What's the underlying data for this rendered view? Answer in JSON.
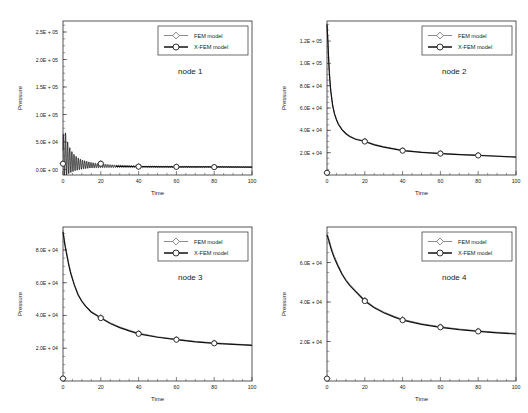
{
  "figure": {
    "background": "#ffffff",
    "panel_count": 4,
    "colors": {
      "fem": "#8c8c8c",
      "xfem": "#111111",
      "axis": "#2b2b2b"
    }
  },
  "legend": {
    "fem_label": "FEM model",
    "xfem_label": "X-FEM model",
    "fem_marker": "diamond-open",
    "xfem_marker": "circle-open",
    "position": "top-right"
  },
  "axes": {
    "xlabel": "Time",
    "ylabel": "Pressure",
    "xticks": [
      "0",
      "20",
      "40",
      "60",
      "80",
      "100"
    ],
    "xlim": [
      0,
      100
    ]
  },
  "chart_data": [
    {
      "type": "line",
      "title": "node 1",
      "xlabel": "Time",
      "ylabel": "Pressure",
      "xlim": [
        0,
        100
      ],
      "ylim": [
        -10000,
        270000
      ],
      "xticks": [
        0,
        20,
        40,
        60,
        80,
        100
      ],
      "yticks": [
        0,
        50000,
        100000,
        150000,
        200000,
        250000
      ],
      "ytick_labels": [
        "0.0E + 00",
        "5.0E + 04",
        "1.0E + 05",
        "1.5E + 05",
        "2.0E + 05",
        "2.5E + 05"
      ],
      "grid": false,
      "legend_position": "top-right",
      "note": "strongly oscillatory decaying pressure response",
      "oscillatory": true,
      "series": [
        {
          "name": "FEM model",
          "marker": "diamond-open",
          "color": "#8c8c8c",
          "marker_x": [
            0,
            20,
            40,
            60,
            80
          ],
          "marker_y": [
            11000,
            11000,
            5500,
            5000,
            4500
          ]
        },
        {
          "name": "X-FEM model",
          "marker": "circle-open",
          "color": "#111111",
          "marker_x": [
            0,
            20,
            40,
            60,
            80
          ],
          "marker_y": [
            10500,
            10500,
            5200,
            4800,
            4300
          ]
        }
      ],
      "envelope": {
        "x": [
          0,
          1,
          2,
          4,
          6,
          8,
          10,
          14,
          18,
          22,
          26,
          30,
          36,
          42,
          50,
          60,
          75,
          90,
          100
        ],
        "upper": [
          110000,
          96000,
          80000,
          58000,
          46000,
          38000,
          32000,
          24000,
          19000,
          16000,
          13500,
          11500,
          9500,
          8200,
          7200,
          6400,
          5800,
          5400,
          5200
        ],
        "lower": [
          0,
          2000,
          2500,
          1500,
          1000,
          800,
          700,
          600,
          500,
          500,
          400,
          400,
          400,
          400,
          400,
          400,
          400,
          400,
          400
        ],
        "center": [
          11000,
          30000,
          22000,
          15000,
          12000,
          10000,
          9000,
          8000,
          7000,
          6500,
          6000,
          5800,
          5500,
          5200,
          5000,
          4800,
          4600,
          4500,
          4400
        ]
      }
    },
    {
      "type": "line",
      "title": "node 2",
      "xlabel": "Time",
      "ylabel": "Pressure",
      "xlim": [
        0,
        100
      ],
      "ylim": [
        0,
        138000
      ],
      "xticks": [
        0,
        20,
        40,
        60,
        80,
        100
      ],
      "yticks": [
        20000,
        40000,
        60000,
        80000,
        100000,
        120000
      ],
      "ytick_labels": [
        "2.0E + 04",
        "4.0E + 04",
        "6.0E + 04",
        "8.0E + 04",
        "1.0E + 05",
        "1.2E + 05"
      ],
      "grid": false,
      "legend_position": "top-right",
      "oscillatory": false,
      "x": [
        0,
        0.5,
        1,
        1.5,
        2,
        3,
        4,
        5,
        6,
        8,
        10,
        12,
        15,
        20,
        25,
        30,
        35,
        40,
        50,
        60,
        70,
        80,
        90,
        100
      ],
      "series": [
        {
          "name": "FEM model",
          "marker": "diamond-open",
          "color": "#8c8c8c",
          "values": [
            136000,
            120000,
            100000,
            86000,
            76000,
            63000,
            55000,
            50000,
            46000,
            41000,
            37500,
            35000,
            32500,
            30500,
            27500,
            25500,
            23800,
            22200,
            20500,
            19500,
            18500,
            17800,
            17000,
            16200
          ],
          "marker_x": [
            0,
            20,
            40,
            60,
            80
          ],
          "marker_y": [
            2000,
            30500,
            22200,
            19500,
            17800
          ]
        },
        {
          "name": "X-FEM model",
          "marker": "circle-open",
          "color": "#111111",
          "values": [
            135000,
            118000,
            98500,
            85000,
            75000,
            62000,
            54500,
            49500,
            45500,
            40500,
            37000,
            34500,
            32000,
            30000,
            27000,
            25000,
            23400,
            21800,
            20200,
            19200,
            18200,
            17500,
            16800,
            16000
          ],
          "marker_x": [
            0,
            20,
            40,
            60,
            80
          ],
          "marker_y": [
            2000,
            30000,
            21800,
            19200,
            17500
          ]
        }
      ]
    },
    {
      "type": "line",
      "title": "node 3",
      "xlabel": "Time",
      "ylabel": "Pressure",
      "xlim": [
        0,
        100
      ],
      "ylim": [
        0,
        94000
      ],
      "xticks": [
        0,
        20,
        40,
        60,
        80,
        100
      ],
      "yticks": [
        20000,
        40000,
        60000,
        80000
      ],
      "ytick_labels": [
        "2.0E + 04",
        "4.0E + 04",
        "6.0E + 04",
        "8.0E + 04"
      ],
      "grid": false,
      "legend_position": "top-right",
      "oscillatory": false,
      "x": [
        0,
        0.5,
        1,
        2,
        3,
        4,
        6,
        8,
        10,
        12,
        15,
        20,
        25,
        30,
        35,
        40,
        50,
        60,
        70,
        80,
        90,
        100
      ],
      "series": [
        {
          "name": "FEM model",
          "marker": "diamond-open",
          "color": "#8c8c8c",
          "values": [
            92000,
            88000,
            84000,
            78000,
            72000,
            67000,
            59000,
            53000,
            49000,
            46000,
            42500,
            38800,
            35500,
            33000,
            31000,
            29200,
            27000,
            25500,
            24200,
            23300,
            22600,
            22000
          ],
          "marker_x": [
            0,
            20,
            40,
            60,
            80
          ],
          "marker_y": [
            1500,
            38800,
            29200,
            25500,
            23300
          ]
        },
        {
          "name": "X-FEM model",
          "marker": "circle-open",
          "color": "#111111",
          "values": [
            91000,
            87000,
            83000,
            77000,
            71000,
            66000,
            58500,
            52500,
            48500,
            45500,
            42000,
            38400,
            35100,
            32600,
            30600,
            28800,
            26700,
            25200,
            23900,
            23000,
            22300,
            21700
          ],
          "marker_x": [
            0,
            20,
            40,
            60,
            80
          ],
          "marker_y": [
            1500,
            38400,
            28800,
            25200,
            23000
          ]
        }
      ]
    },
    {
      "type": "line",
      "title": "node 4",
      "xlabel": "Time",
      "ylabel": "Pressure",
      "xlim": [
        0,
        100
      ],
      "ylim": [
        0,
        78000
      ],
      "xticks": [
        0,
        20,
        40,
        60,
        80,
        100
      ],
      "yticks": [
        20000,
        40000,
        60000
      ],
      "ytick_labels": [
        "2.0E + 04",
        "4.0E + 04",
        "6.0E + 04"
      ],
      "grid": false,
      "legend_position": "top-right",
      "oscillatory": false,
      "x": [
        0,
        0.5,
        1,
        2,
        3,
        4,
        6,
        8,
        10,
        12,
        15,
        20,
        25,
        30,
        35,
        40,
        50,
        60,
        70,
        80,
        90,
        100
      ],
      "series": [
        {
          "name": "FEM model",
          "marker": "diamond-open",
          "color": "#8c8c8c",
          "values": [
            75000,
            73500,
            72000,
            68500,
            65500,
            63000,
            58500,
            54500,
            51500,
            49000,
            46000,
            41000,
            37500,
            35000,
            33000,
            31200,
            29000,
            27500,
            26300,
            25400,
            24700,
            24100
          ],
          "marker_x": [
            0,
            20,
            40,
            60,
            80
          ],
          "marker_y": [
            1200,
            41000,
            31200,
            27500,
            25400
          ]
        },
        {
          "name": "X-FEM model",
          "marker": "circle-open",
          "color": "#111111",
          "values": [
            74000,
            72500,
            71000,
            67500,
            64500,
            62000,
            57800,
            53900,
            50900,
            48400,
            45400,
            40500,
            37100,
            34600,
            32600,
            30800,
            28700,
            27200,
            26000,
            25100,
            24400,
            23800
          ],
          "marker_x": [
            0,
            20,
            40,
            60,
            80
          ],
          "marker_y": [
            1200,
            40500,
            30800,
            27200,
            25100
          ]
        }
      ]
    }
  ]
}
